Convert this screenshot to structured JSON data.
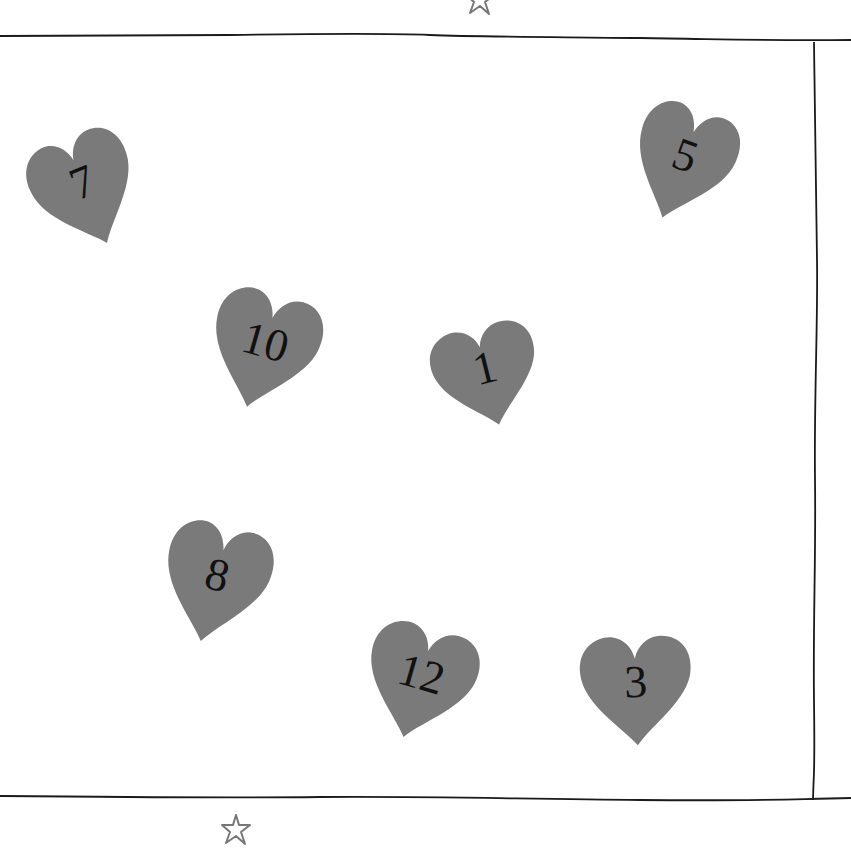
{
  "colors": {
    "heart_fill": "#7a7a7a",
    "line": "#1a1a1a",
    "star_stroke": "#777777",
    "background": "#ffffff"
  },
  "hearts": [
    {
      "label": "7",
      "x": 30,
      "y": 128,
      "w": 112,
      "h": 126,
      "rotate": -22
    },
    {
      "label": "5",
      "x": 628,
      "y": 100,
      "w": 108,
      "h": 128,
      "rotate": 20
    },
    {
      "label": "10",
      "x": 205,
      "y": 286,
      "w": 116,
      "h": 130,
      "rotate": 16
    },
    {
      "label": "1",
      "x": 430,
      "y": 320,
      "w": 114,
      "h": 112,
      "rotate": -14
    },
    {
      "label": "8",
      "x": 158,
      "y": 518,
      "w": 114,
      "h": 132,
      "rotate": 14
    },
    {
      "label": "12",
      "x": 360,
      "y": 620,
      "w": 118,
      "h": 126,
      "rotate": 16
    },
    {
      "label": "3",
      "x": 576,
      "y": 630,
      "w": 120,
      "h": 122,
      "rotate": -2
    }
  ],
  "stars": [
    {
      "name": "top",
      "x": 462,
      "y": -18
    },
    {
      "name": "bottom",
      "x": 218,
      "y": 812
    }
  ]
}
